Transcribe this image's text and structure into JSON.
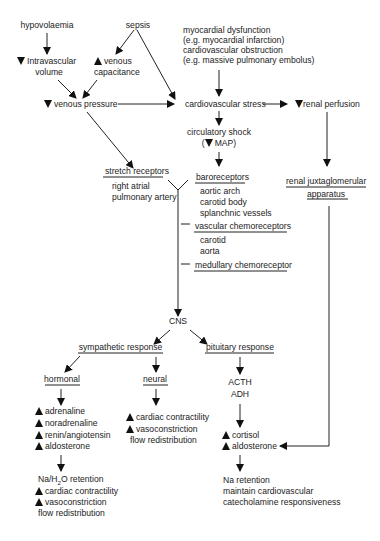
{
  "diagram": {
    "causes": {
      "hypovolaemia": "hypovolaemia",
      "sepsis": "sepsis",
      "cardiac": [
        "myocardial dysfunction",
        "(e.g. myocardial infarction)",
        "cardiovascular obstruction",
        "(e.g. massive pulmonary embolus)"
      ]
    },
    "intravascular_volume": [
      "Intravascular",
      "volume"
    ],
    "venous_capacitance": [
      "venous",
      "capacitance"
    ],
    "venous_pressure": "venous pressure",
    "cardiovascular_stress": "cardiovascular stress",
    "renal_perfusion": "renal perfusion",
    "circulatory_shock": [
      "circulatory shock",
      "MAP)"
    ],
    "stretch_receptors": {
      "title": "stretch receptors",
      "items": [
        "right atrial",
        "pulmonary artery"
      ]
    },
    "baroreceptors": {
      "title": "baroreceptors",
      "items": [
        "aortic arch",
        "carotid body",
        "splanchnic vessels"
      ]
    },
    "vascular_chemoreceptors": {
      "title": "vascular chemoreceptors",
      "items": [
        "carotid",
        "aorta"
      ]
    },
    "medullary_chemoreceptor": "medullary chemoreceptor",
    "renal_jga": [
      "renal juxtaglomerular",
      "apparatus"
    ],
    "cns": "CNS",
    "sympathetic_response": "sympathetic response",
    "pituitary_response": "pituitary response",
    "hormonal": {
      "title": "hormonal",
      "increases": [
        "adrenaline",
        "noradrenaline",
        "renin/angiotensin",
        "aldosterone"
      ],
      "effects": {
        "na_h2o_prefix": "Na/H",
        "na_h2o_sub": "2",
        "na_h2o_suffix": "O retention",
        "increases": [
          "cardiac contractility",
          "vasoconstriction"
        ],
        "plain": "flow redistribution"
      }
    },
    "neural": {
      "title": "neural",
      "increases": [
        "cardiac contractility",
        "vasoconstriction"
      ],
      "plain": "flow redistribution"
    },
    "pituitary_hormones": [
      "ACTH",
      "ADH"
    ],
    "pituitary_increases": [
      "cortisol",
      "aldosterone"
    ],
    "pituitary_effects": [
      "Na retention",
      "maintain cardiovascular",
      "catecholamine responsiveness"
    ],
    "symbols": {
      "increase": "up-triangle",
      "decrease": "down-triangle"
    },
    "colors": {
      "ink": "#111111",
      "background": "#ffffff"
    }
  }
}
